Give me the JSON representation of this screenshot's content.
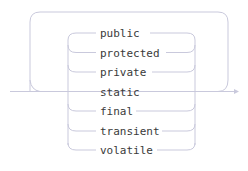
{
  "diagram": {
    "type": "railroad-syntax-diagram",
    "colors": {
      "line": "#c9c9dc",
      "text": "#3a3a3a",
      "background": "#ffffff"
    },
    "loop": "repeat (zero or more)",
    "choices": [
      {
        "label": "public"
      },
      {
        "label": "protected"
      },
      {
        "label": "private"
      },
      {
        "label": "static"
      },
      {
        "label": "final"
      },
      {
        "label": "transient"
      },
      {
        "label": "volatile"
      }
    ]
  }
}
